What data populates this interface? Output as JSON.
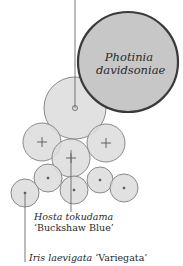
{
  "diagram": {
    "type": "planting-plan",
    "background": "#ffffff",
    "colors": {
      "fill_light": "#dcdcdc",
      "fill_dark": "#c7c7c7",
      "stroke_light": "#8a8a8a",
      "stroke_dark": "#3a3a3a",
      "text": "#2a2a2a"
    },
    "labels": {
      "photinia_line1": "Photinia",
      "photinia_line2": "davidsoniae",
      "hosta_line1": "Hosta tokudama",
      "hosta_line2": "‘Buckshaw Blue’",
      "iris_genus": "Iris laevigata",
      "iris_cultivar": "‘Variegata’"
    },
    "plants": [
      {
        "name": "Photinia davidsoniae",
        "symbol": "none",
        "cx": 128,
        "cy": 62,
        "r": 50,
        "style": "dark"
      },
      {
        "name": "unlabeled-medium",
        "symbol": "dot",
        "cx": 75,
        "cy": 108,
        "r": 31,
        "style": "light"
      },
      {
        "name": "cross-left",
        "symbol": "cross",
        "cx": 42,
        "cy": 142,
        "r": 19,
        "style": "light"
      },
      {
        "name": "Hosta tokudama 'Buckshaw Blue'",
        "symbol": "cross",
        "cx": 71,
        "cy": 158,
        "r": 19,
        "style": "light"
      },
      {
        "name": "cross-right",
        "symbol": "cross",
        "cx": 106,
        "cy": 143,
        "r": 19,
        "style": "light"
      },
      {
        "name": "Iris laevigata 'Variegata'",
        "symbol": "dot",
        "cx": 25,
        "cy": 193,
        "r": 14,
        "style": "light"
      },
      {
        "name": "dot-2",
        "symbol": "dot",
        "cx": 48,
        "cy": 178,
        "r": 14,
        "style": "light"
      },
      {
        "name": "dot-3",
        "symbol": "dot",
        "cx": 74,
        "cy": 190,
        "r": 14,
        "style": "light"
      },
      {
        "name": "dot-4",
        "symbol": "dot",
        "cx": 100,
        "cy": 180,
        "r": 13,
        "style": "light"
      },
      {
        "name": "dot-5",
        "symbol": "dot",
        "cx": 124,
        "cy": 188,
        "r": 14,
        "style": "light"
      }
    ],
    "leader_lines": [
      {
        "from": [
          75,
          0
        ],
        "to": [
          75,
          108
        ]
      },
      {
        "from": [
          71,
          150
        ],
        "to": [
          71,
          212
        ]
      },
      {
        "from": [
          25,
          193
        ],
        "to": [
          25,
          262
        ]
      }
    ]
  }
}
